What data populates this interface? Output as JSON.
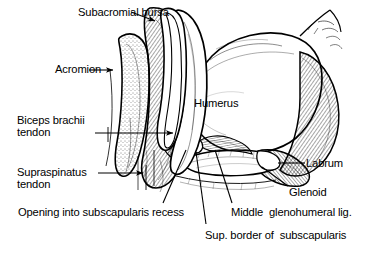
{
  "figure": {
    "background_color": "#ffffff",
    "ink_color": "#000000"
  },
  "labels": {
    "subacromial_bursa": "Subacromial bursa",
    "acromion": "Acromion",
    "biceps_line1": "Biceps brachii",
    "biceps_line2": "tendon",
    "humerus": "Humerus",
    "supraspinatus_line1": "Supraspinatus",
    "supraspinatus_line2": "tendon",
    "labrum": "Labrum",
    "glenoid": "Glenoid",
    "opening_recess": "Opening into subscapularis recess",
    "middle_glenohumeral": "Middle  glenohumeral lig.",
    "sup_border": "Sup. border of  subscapularis"
  },
  "structures": [
    "subacromial-bursa",
    "acromion-bone",
    "supraspinatus-tendon",
    "biceps-brachii-tendon",
    "humeral-head",
    "glenoid-fossa",
    "glenoid-labrum",
    "middle-glenohumeral-ligament",
    "subscapularis-muscle",
    "joint-capsule"
  ]
}
